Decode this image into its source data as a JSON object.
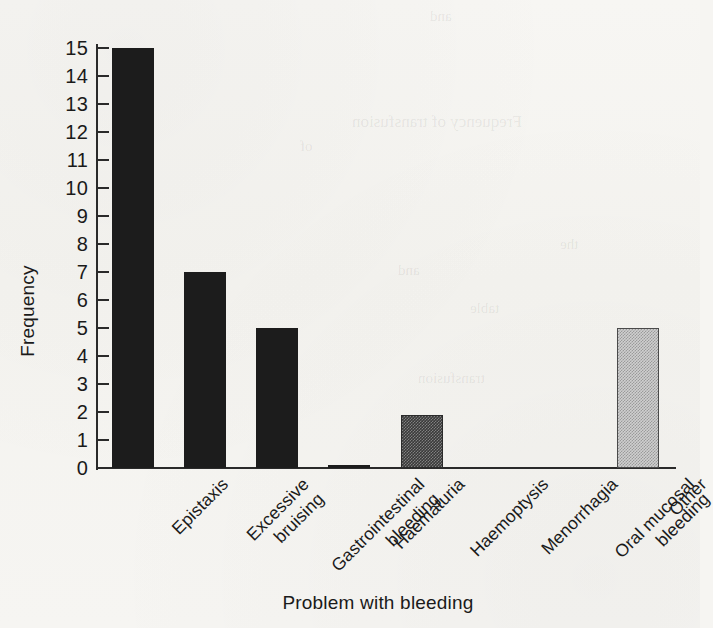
{
  "chart_data": {
    "type": "bar",
    "title": "",
    "xlabel": "Problem with bleeding",
    "ylabel": "Frequency",
    "categories": [
      "Epistaxis",
      "Excessive\nbruising",
      "Gastrointestinal\nbleeding",
      "Haematuria",
      "Haemoptysis",
      "Menorrhagia",
      "Oral mucosal\nbleeding",
      "Other"
    ],
    "values": [
      15,
      7,
      5,
      0.1,
      1.9,
      0,
      0,
      5
    ],
    "ylim": [
      0,
      15
    ],
    "yticks": [
      0,
      1,
      2,
      3,
      4,
      5,
      6,
      7,
      8,
      9,
      10,
      11,
      12,
      13,
      14,
      15
    ],
    "ytick_labels": [
      "0",
      "1",
      "2",
      "3",
      "4",
      "5",
      "6",
      "7",
      "8",
      "9",
      "10",
      "11",
      "12",
      "13",
      "14",
      "15"
    ],
    "grid": false,
    "legend": false,
    "bar_styles": [
      "solid-dark",
      "solid-dark",
      "solid-dark",
      "solid-dark",
      "stipple-dark",
      "solid-dark",
      "solid-dark",
      "stipple-light"
    ],
    "colors": {
      "bar_dark": "#1c1c1c",
      "bar_stipple_dark": "#3a3a3a",
      "bar_stipple_light": "#cfcfcf",
      "axis": "#2a2a2a",
      "text": "#1a1a1a",
      "background": "#f6f5f2"
    }
  },
  "page": {
    "showthrough": [
      {
        "text": "and",
        "left": 430,
        "top": 8,
        "size": 15
      },
      {
        "text": "Frequency of transfusion",
        "left": 352,
        "top": 112,
        "size": 17
      },
      {
        "text": "of",
        "left": 300,
        "top": 138,
        "size": 15
      },
      {
        "text": "the",
        "left": 560,
        "top": 236,
        "size": 15
      },
      {
        "text": "and",
        "left": 398,
        "top": 262,
        "size": 15
      },
      {
        "text": "table",
        "left": 470,
        "top": 300,
        "size": 15
      },
      {
        "text": "transfusion",
        "left": 418,
        "top": 370,
        "size": 15
      }
    ]
  }
}
